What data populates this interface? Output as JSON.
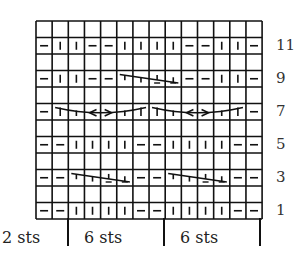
{
  "chart_data": {
    "type": "knitting-chart",
    "columns": 14,
    "rows": 12,
    "grid": [
      [
        "",
        "",
        "",
        "",
        "",
        "",
        "",
        "",
        "",
        "",
        "",
        "",
        "",
        ""
      ],
      [
        "p",
        "k",
        "k",
        "p",
        "p",
        "k",
        "k",
        "k",
        "k",
        "p",
        "p",
        "k",
        "k",
        "p"
      ],
      [
        "",
        "",
        "",
        "",
        "",
        "",
        "",
        "",
        "",
        "",
        "",
        "",
        "",
        ""
      ],
      [
        "p",
        "k",
        "k",
        "p",
        "p",
        "c4",
        "c4",
        "c4",
        "c4",
        "p",
        "p",
        "k",
        "k",
        "p"
      ],
      [
        "",
        "",
        "",
        "",
        "",
        "",
        "",
        "",
        "",
        "",
        "",
        "",
        "",
        ""
      ],
      [
        "p",
        "c6a",
        "c6a",
        "c6a",
        "c6a",
        "c6a",
        "c6a",
        "c6b",
        "c6b",
        "c6b",
        "c6b",
        "c6b",
        "c6b",
        "p"
      ],
      [
        "",
        "",
        "",
        "",
        "",
        "",
        "",
        "",
        "",
        "",
        "",
        "",
        "",
        ""
      ],
      [
        "p",
        "p",
        "k",
        "k",
        "k",
        "k",
        "p",
        "p",
        "k",
        "k",
        "k",
        "k",
        "p",
        "p"
      ],
      [
        "",
        "",
        "",
        "",
        "",
        "",
        "",
        "",
        "",
        "",
        "",
        "",
        "",
        ""
      ],
      [
        "p",
        "p",
        "c4",
        "c4",
        "c4",
        "c4",
        "p",
        "p",
        "c4",
        "c4",
        "c4",
        "c4",
        "p",
        "p"
      ],
      [
        "",
        "",
        "",
        "",
        "",
        "",
        "",
        "",
        "",
        "",
        "",
        "",
        "",
        ""
      ],
      [
        "p",
        "p",
        "k",
        "k",
        "k",
        "k",
        "p",
        "p",
        "k",
        "k",
        "k",
        "k",
        "p",
        "p"
      ]
    ],
    "cables": [
      {
        "row": 3,
        "start_col": 5,
        "span": 4,
        "type": "right-slant"
      },
      {
        "row": 5,
        "start_col": 1,
        "span": 6,
        "type": "cross"
      },
      {
        "row": 5,
        "start_col": 7,
        "span": 6,
        "type": "cross"
      },
      {
        "row": 9,
        "start_col": 2,
        "span": 4,
        "type": "right-slant"
      },
      {
        "row": 9,
        "start_col": 8,
        "span": 4,
        "type": "right-slant"
      }
    ],
    "row_labels": [
      "11",
      "9",
      "7",
      "5",
      "3",
      "1"
    ],
    "bottom_labels": [
      "2 sts",
      "6 sts",
      "6 sts"
    ],
    "legend": {
      "k": "|",
      "p": "–"
    }
  }
}
